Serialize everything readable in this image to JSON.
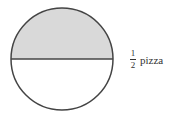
{
  "diagram": {
    "shape": "circle",
    "divided_into": 2,
    "shaded_parts": 1,
    "shaded_region": "top-half",
    "colors": {
      "shade": "#d9d9d9",
      "stroke": "#444444",
      "background": "#ffffff"
    },
    "label": {
      "numerator": "1",
      "denominator": "2",
      "text": "pizza"
    }
  }
}
